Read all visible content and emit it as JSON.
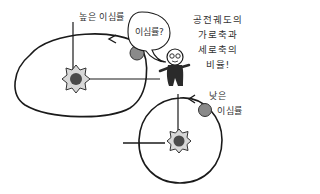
{
  "diagram": {
    "topic": "orbital eccentricity",
    "labels": {
      "high_eccentricity": "높은 이심률",
      "low_eccentricity": "낮은 이심률",
      "low_eccentricity_line1": "낮은",
      "low_eccentricity_line2": "이심률",
      "speech_bubble": "이심률?",
      "explanation_lines": [
        "공전궤도의",
        "가로축과",
        "세로축의",
        "비율!"
      ]
    },
    "orbits": [
      {
        "name": "high-eccentricity-orbit",
        "shape": "ellipse",
        "has_star": true,
        "has_planet": true,
        "direction": "counterclockwise"
      },
      {
        "name": "low-eccentricity-orbit",
        "shape": "near-circle",
        "has_star": true,
        "has_planet": true,
        "direction": "counterclockwise"
      }
    ],
    "colors": {
      "line": "#1a1a1a",
      "planet": "#8a8a8a",
      "star_core": "#4a4a4a",
      "star_halo": "#d8d8d8",
      "character": "#2a2a2a",
      "background": "#ffffff"
    },
    "icons": [
      "star-icon",
      "planet-icon",
      "arrow-icon",
      "character-icon",
      "speech-bubble-icon"
    ]
  }
}
